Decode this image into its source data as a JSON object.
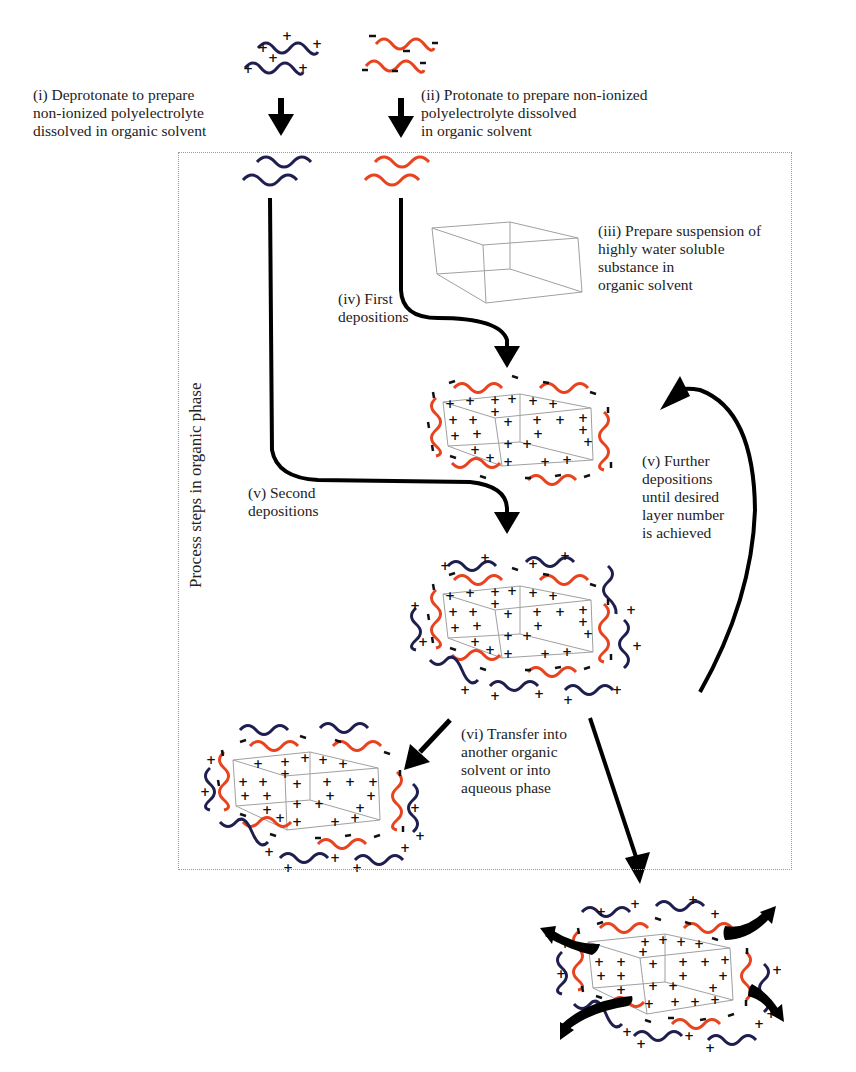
{
  "diagram": {
    "colors": {
      "cationic_polymer": "#1f1f4f",
      "anionic_polymer": "#e8421e",
      "arrow": "#000000",
      "crystal_outline": "#9a9a9a",
      "phase_box_border": "#9a9a9a"
    },
    "phase_box_label": "Process steps in organic phase",
    "steps": [
      {
        "id": "i",
        "text": "(i) Deprotonate to prepare\nnon-ionized polyelectrolyte\ndissolved in organic solvent"
      },
      {
        "id": "ii",
        "text": "(ii) Protonate to prepare non-ionized\npolyelectrolyte dissolved\nin organic solvent"
      },
      {
        "id": "iii",
        "text": "(iii) Prepare suspension of\nhighly water soluble\nsubstance in\norganic solvent"
      },
      {
        "id": "iv",
        "text": "(iv) First\ndepositions"
      },
      {
        "id": "v_second",
        "text": "(v) Second\ndepositions"
      },
      {
        "id": "v_further",
        "text": "(v) Further\ndepositions\nuntil desired\nlayer number\nis achieved"
      },
      {
        "id": "vi",
        "text": "(vi) Transfer into\nanother organic\nsolvent or into\naqueous phase"
      }
    ],
    "charge_symbols": {
      "positive": "+",
      "negative": "−"
    }
  }
}
